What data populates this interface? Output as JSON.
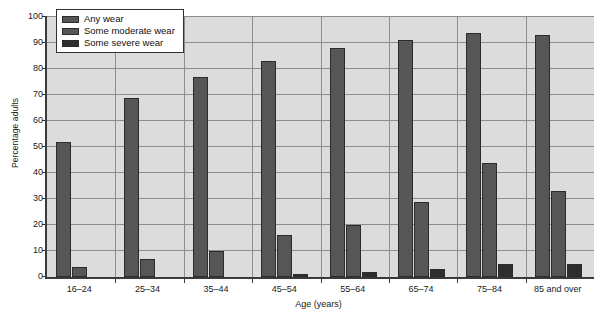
{
  "chart_data": {
    "type": "bar",
    "title": "",
    "xlabel": "Age (years)",
    "ylabel": "Percentage adults",
    "ylim": [
      0,
      100
    ],
    "ytick_step": 10,
    "yticks": [
      0,
      10,
      20,
      30,
      40,
      50,
      60,
      70,
      80,
      90,
      100
    ],
    "grid": true,
    "legend_position": "top-left",
    "categories": [
      "16–24",
      "25–34",
      "35–44",
      "45–54",
      "55–64",
      "65–74",
      "75–84",
      "85 and over"
    ],
    "series": [
      {
        "name": "Any wear",
        "values": [
          52,
          69,
          77,
          83,
          88,
          91,
          94,
          93
        ]
      },
      {
        "name": "Some moderate wear",
        "values": [
          4,
          7,
          10,
          16,
          20,
          29,
          44,
          33
        ]
      },
      {
        "name": "Some severe wear",
        "values": [
          0,
          0,
          0,
          1,
          2,
          3,
          5,
          5
        ]
      }
    ],
    "colors": {
      "any_wear": "#565656",
      "some_moderate_wear": "#565656",
      "some_severe_wear": "#2e2e2e",
      "plot_background": "#dcdcdc",
      "gridline": "#8d8d8d",
      "axis": "#3a3a3a",
      "bar_outline": "#2b2b2b"
    }
  }
}
